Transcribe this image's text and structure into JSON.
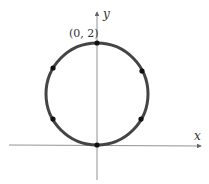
{
  "figure": {
    "type": "circle-graph",
    "labels": {
      "x_axis": "x",
      "y_axis": "y",
      "top_point": "(0, 2)"
    },
    "circle": {
      "center_math": [
        0,
        1
      ],
      "radius_math": 1,
      "stroke_color": "#444444"
    },
    "points": [
      {
        "name": "top",
        "math": [
          0,
          2
        ]
      },
      {
        "name": "bottom",
        "math": [
          0,
          0
        ]
      },
      {
        "name": "upper-left",
        "angle_deg": 140
      },
      {
        "name": "upper-right",
        "angle_deg": 35
      },
      {
        "name": "lower-left",
        "angle_deg": 220
      },
      {
        "name": "lower-right",
        "angle_deg": 325
      }
    ],
    "axis_color": "#666666"
  }
}
